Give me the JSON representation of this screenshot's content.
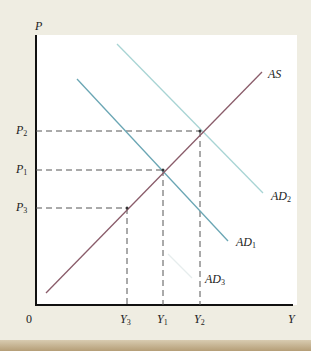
{
  "diagram": {
    "title": "",
    "axes": {
      "y_label": "P",
      "x_label": "Y",
      "origin_label": "0"
    },
    "curves": [
      {
        "id": "AS",
        "label": "AS",
        "sub": "",
        "color": "#8a5c6a"
      },
      {
        "id": "AD2",
        "label": "AD",
        "sub": "2",
        "color": "#a8d4d4"
      },
      {
        "id": "AD1",
        "label": "AD",
        "sub": "1",
        "color": "#6aa6b4"
      },
      {
        "id": "AD3",
        "label": "AD",
        "sub": "3",
        "color": "#ecf1f1"
      }
    ],
    "price_levels": [
      {
        "label": "P",
        "sub": "2"
      },
      {
        "label": "P",
        "sub": "1"
      },
      {
        "label": "P",
        "sub": "3"
      }
    ],
    "output_levels": [
      {
        "label": "Y",
        "sub": "3"
      },
      {
        "label": "Y",
        "sub": "1"
      },
      {
        "label": "Y",
        "sub": "2"
      }
    ]
  },
  "colors": {
    "background": "#efede2",
    "panel": "#ffffff",
    "axis": "#111111",
    "dashed": "#555555"
  }
}
